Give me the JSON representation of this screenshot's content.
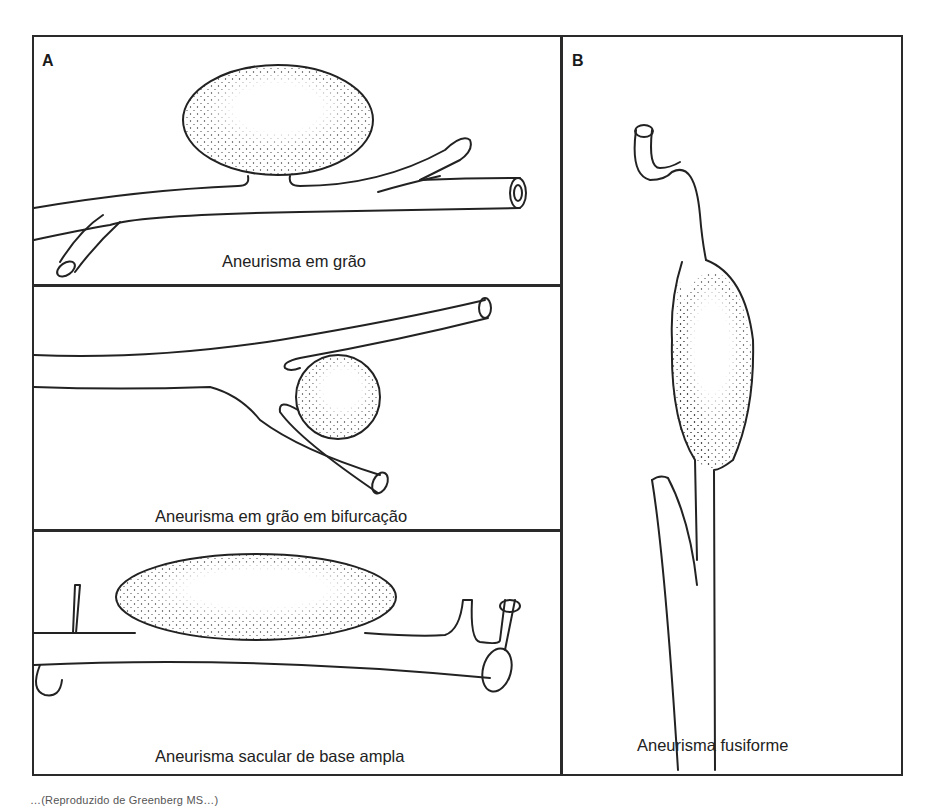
{
  "figure": {
    "panels": [
      {
        "label": "A",
        "subpanels": [
          {
            "caption": "Aneurisma em grão"
          },
          {
            "caption": "Aneurisma em grão em bifurcação"
          },
          {
            "caption": "Aneurisma sacular de base ampla"
          }
        ]
      },
      {
        "label": "B",
        "subpanels": [
          {
            "caption": "Aneurisma fusiforme"
          }
        ]
      }
    ],
    "source_line_partial": "…(Reproduzido de Greenberg MS…)"
  },
  "colors": {
    "line": "#2a2a2a",
    "background": "#ffffff",
    "text": "#222222"
  }
}
